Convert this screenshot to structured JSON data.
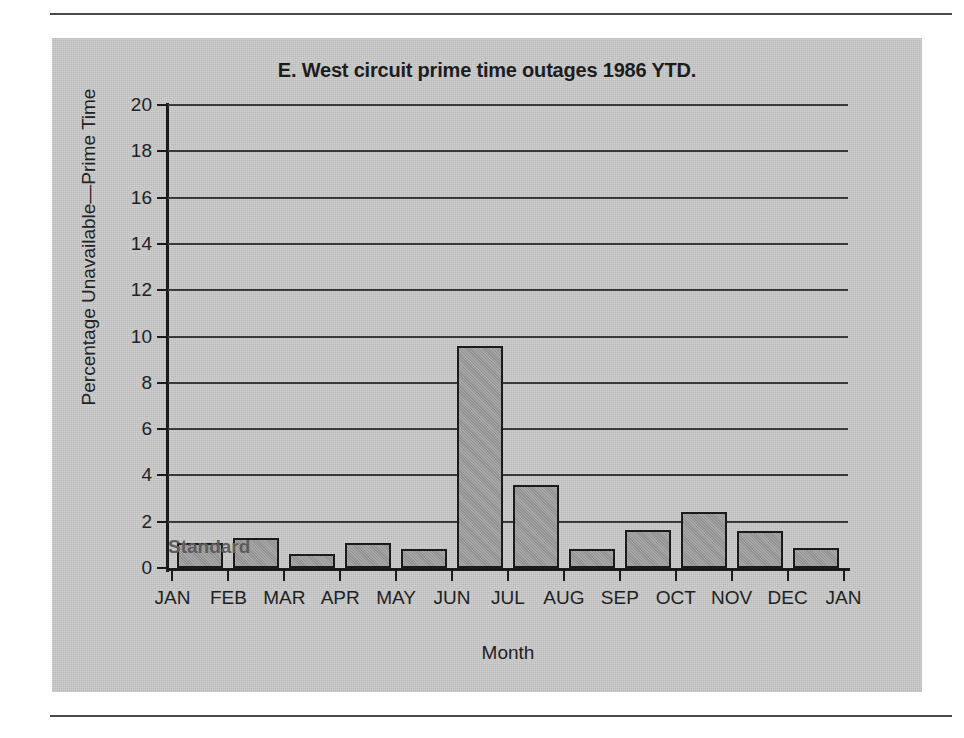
{
  "chart_data": {
    "type": "bar",
    "title": "E. West circuit prime time outages 1986 YTD.",
    "xlabel": "Month",
    "ylabel": "Percentage Unavailable—Prime Time",
    "categories": [
      "JAN",
      "FEB",
      "MAR",
      "APR",
      "MAY",
      "JUN",
      "JUL",
      "AUG",
      "SEP",
      "OCT",
      "NOV",
      "DEC",
      "JAN"
    ],
    "values": [
      1.1,
      1.3,
      0.6,
      1.1,
      0.8,
      9.6,
      3.6,
      0.8,
      1.65,
      2.4,
      1.6,
      0.85,
      null
    ],
    "ylim": [
      0,
      20
    ],
    "ytick_labels": [
      "0",
      "2",
      "4",
      "6",
      "8",
      "10",
      "12",
      "14",
      "16",
      "18",
      "20"
    ],
    "ytick_values": [
      0,
      2,
      4,
      6,
      8,
      10,
      12,
      14,
      16,
      18,
      20
    ],
    "grid": "horizontal",
    "legend": "none",
    "annotations": [
      {
        "text": "Standard",
        "value": 2,
        "note": "label above the 2 percent gridline"
      }
    ],
    "colors": {
      "bar_fill": "#9d9d9d",
      "bar_outline": "#1b1b1b",
      "panel_background": "#c9c9c9",
      "gridline": "#3a3a3a",
      "text": "#222222",
      "annotation_text": "#5d5d5d",
      "rule": "#4a4a4a"
    }
  }
}
